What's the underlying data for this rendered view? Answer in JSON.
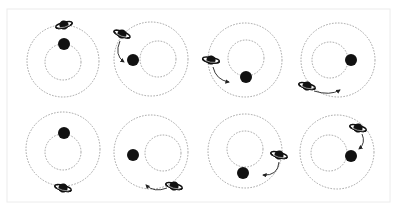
{
  "diagram": {
    "title": "",
    "colors": {
      "background": "#ffffff",
      "frame": "#ececec",
      "orbit": "#9a9a9a",
      "body": "#111111",
      "arrow": "#222222"
    },
    "frame": {
      "x": 7,
      "y": 9,
      "w": 383,
      "h": 193
    },
    "panels": [
      {
        "id": "top-1",
        "outer": [
          63,
          61,
          36
        ],
        "inner": [
          63,
          62,
          18
        ],
        "star": [
          64,
          44,
          6
        ],
        "planet": [
          64,
          25,
          -15
        ],
        "arrow": null
      },
      {
        "id": "top-2",
        "outer": [
          151,
          59,
          37
        ],
        "inner": [
          158,
          59,
          18
        ],
        "star": [
          133,
          60,
          6
        ],
        "planet": [
          122,
          34,
          20
        ],
        "arrow": {
          "d": "M120 41 Q114 55 124 62",
          "tip": [
            125,
            63,
            40
          ]
        }
      },
      {
        "id": "top-3",
        "outer": [
          245,
          60,
          37
        ],
        "inner": [
          246,
          58,
          18
        ],
        "star": [
          246,
          77,
          6
        ],
        "planet": [
          211,
          60,
          10
        ],
        "arrow": {
          "d": "M213 67 Q216 80 229 82",
          "tip": [
            230,
            82,
            5
          ]
        }
      },
      {
        "id": "top-4",
        "outer": [
          338,
          60,
          37
        ],
        "inner": [
          330,
          60,
          18
        ],
        "star": [
          351,
          60,
          6
        ],
        "planet": [
          307,
          86,
          15
        ],
        "arrow": {
          "d": "M314 91 Q330 96 340 90",
          "tip": [
            341,
            89,
            -35
          ]
        }
      },
      {
        "id": "bottom-1",
        "outer": [
          63,
          149,
          37
        ],
        "inner": [
          63,
          152,
          18
        ],
        "star": [
          64,
          133,
          6
        ],
        "planet": [
          63,
          188,
          15
        ],
        "arrow": null
      },
      {
        "id": "bottom-2",
        "outer": [
          151,
          152,
          37
        ],
        "inner": [
          163,
          153,
          18
        ],
        "star": [
          133,
          155,
          6
        ],
        "planet": [
          174,
          186,
          15
        ],
        "arrow": {
          "d": "M167 188 Q154 193 146 185",
          "tip": [
            145,
            184,
            220
          ]
        }
      },
      {
        "id": "bottom-3",
        "outer": [
          245,
          151,
          37
        ],
        "inner": [
          245,
          149,
          18
        ],
        "star": [
          243,
          173,
          6
        ],
        "planet": [
          279,
          155,
          15
        ],
        "arrow": {
          "d": "M279 162 Q278 176 263 175",
          "tip": [
            262,
            175,
            180
          ]
        }
      },
      {
        "id": "bottom-4",
        "outer": [
          337,
          152,
          37
        ],
        "inner": [
          329,
          153,
          18
        ],
        "star": [
          351,
          156,
          6
        ],
        "planet": [
          358,
          128,
          15
        ],
        "arrow": {
          "d": "M362 134 Q366 143 359 149",
          "tip": [
            359,
            150,
            120
          ]
        }
      }
    ],
    "icons": {
      "star": "filled-black-circle",
      "planet": "ringed-planet (saturn-like)",
      "arrow": "curved-arrow"
    }
  }
}
